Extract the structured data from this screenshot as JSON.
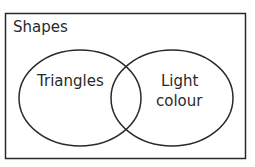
{
  "diagram": {
    "type": "venn",
    "universal_set": {
      "label": "Shapes"
    },
    "sets": [
      {
        "label": "Triangles"
      },
      {
        "label_line1": "Light",
        "label_line2": "colour"
      }
    ],
    "stroke_color": "#2a2a2a",
    "background": "#ffffff"
  }
}
